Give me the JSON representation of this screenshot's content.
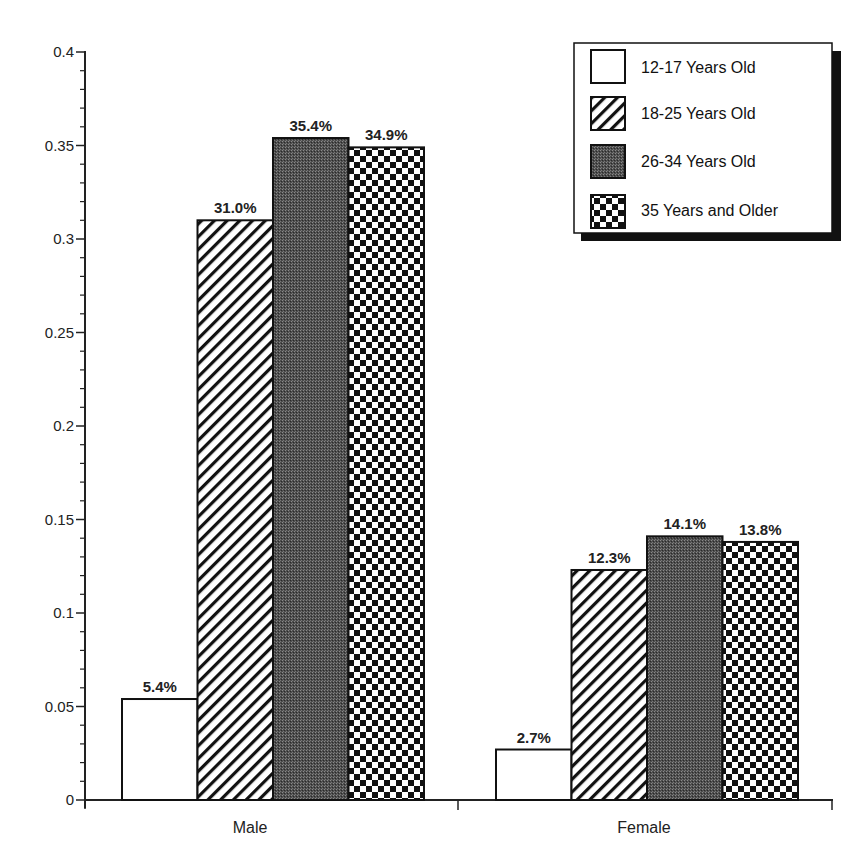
{
  "chart_data": {
    "type": "bar",
    "title": "",
    "xlabel": "",
    "ylabel": "",
    "ylim": [
      0,
      0.4
    ],
    "yticks": [
      "0",
      "0.05",
      "0.1",
      "0.15",
      "0.2",
      "0.25",
      "0.3",
      "0.35",
      "0.4"
    ],
    "ytick_values": [
      0,
      0.05,
      0.1,
      0.15,
      0.2,
      0.25,
      0.3,
      0.35,
      0.4
    ],
    "grid": false,
    "legend_position": "top-right",
    "categories": [
      "Male",
      "Female"
    ],
    "series": [
      {
        "name": "12-17 Years Old",
        "pattern": "white",
        "values": [
          0.054,
          0.027
        ],
        "labels": [
          "5.4%",
          "2.7%"
        ]
      },
      {
        "name": "18-25 Years Old",
        "pattern": "diagonal-hatch",
        "values": [
          0.31,
          0.123
        ],
        "labels": [
          "31.0%",
          "12.3%"
        ]
      },
      {
        "name": "26-34 Years Old",
        "pattern": "dark-stipple",
        "values": [
          0.354,
          0.141
        ],
        "labels": [
          "35.4%",
          "14.1%"
        ]
      },
      {
        "name": "35 Years and Older",
        "pattern": "checkerboard",
        "values": [
          0.349,
          0.138
        ],
        "labels": [
          "34.9%",
          "13.8%"
        ]
      }
    ]
  },
  "colors": {
    "ink": "#111111",
    "dark_fill": "#555555",
    "background": "#ffffff"
  }
}
